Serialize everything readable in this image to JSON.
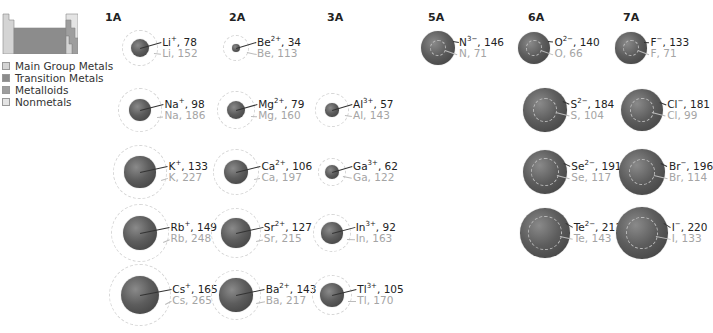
{
  "legend": {
    "items": [
      {
        "label": "Main Group Metals",
        "color": "#d4d4d4"
      },
      {
        "label": "Transition Metals",
        "color": "#8c8c8c"
      },
      {
        "label": "Metalloids",
        "color": "#9e9e9e"
      },
      {
        "label": "Nonmetals",
        "color": "#e4e4e4"
      }
    ]
  },
  "columns": [
    {
      "label": "1A",
      "x": 105
    },
    {
      "label": "2A",
      "x": 229
    },
    {
      "label": "3A",
      "x": 327
    },
    {
      "label": "5A",
      "x": 428
    },
    {
      "label": "6A",
      "x": 528
    },
    {
      "label": "7A",
      "x": 623
    }
  ],
  "ions": [
    {
      "ion": "Li",
      "charge": "+",
      "ion_radius": 78,
      "atom": "Li",
      "atom_radius": 152,
      "cx": 140,
      "cy": 48,
      "type": "cation"
    },
    {
      "ion": "Be",
      "charge": "2+",
      "ion_radius": 34,
      "atom": "Be",
      "atom_radius": 113,
      "cx": 236,
      "cy": 48,
      "type": "cation"
    },
    {
      "ion": "N",
      "charge": "3−",
      "ion_radius": 146,
      "atom": "N",
      "atom_radius": 71,
      "cx": 438,
      "cy": 48,
      "type": "anion"
    },
    {
      "ion": "O",
      "charge": "2−",
      "ion_radius": 140,
      "atom": "O",
      "atom_radius": 66,
      "cx": 534,
      "cy": 48,
      "type": "anion"
    },
    {
      "ion": "F",
      "charge": "−",
      "ion_radius": 133,
      "atom": "F",
      "atom_radius": 71,
      "cx": 631,
      "cy": 48,
      "type": "anion"
    },
    {
      "ion": "Na",
      "charge": "+",
      "ion_radius": 98,
      "atom": "Na",
      "atom_radius": 186,
      "cx": 140,
      "cy": 110,
      "type": "cation"
    },
    {
      "ion": "Mg",
      "charge": "2+",
      "ion_radius": 79,
      "atom": "Mg",
      "atom_radius": 160,
      "cx": 236,
      "cy": 110,
      "type": "cation"
    },
    {
      "ion": "Al",
      "charge": "3+",
      "ion_radius": 57,
      "atom": "Al",
      "atom_radius": 143,
      "cx": 332,
      "cy": 110,
      "type": "cation"
    },
    {
      "ion": "S",
      "charge": "2−",
      "ion_radius": 184,
      "atom": "S",
      "atom_radius": 104,
      "cx": 545,
      "cy": 110,
      "type": "anion"
    },
    {
      "ion": "Cl",
      "charge": "−",
      "ion_radius": 181,
      "atom": "Cl",
      "atom_radius": 99,
      "cx": 642,
      "cy": 110,
      "type": "anion"
    },
    {
      "ion": "K",
      "charge": "+",
      "ion_radius": 133,
      "atom": "K",
      "atom_radius": 227,
      "cx": 140,
      "cy": 172,
      "type": "cation"
    },
    {
      "ion": "Ca",
      "charge": "2+",
      "ion_radius": 106,
      "atom": "Ca",
      "atom_radius": 197,
      "cx": 236,
      "cy": 172,
      "type": "cation"
    },
    {
      "ion": "Ga",
      "charge": "3+",
      "ion_radius": 62,
      "atom": "Ga",
      "atom_radius": 122,
      "cx": 332,
      "cy": 172,
      "type": "cation"
    },
    {
      "ion": "Se",
      "charge": "2−",
      "ion_radius": 191,
      "atom": "Se",
      "atom_radius": 117,
      "cx": 545,
      "cy": 172,
      "type": "anion"
    },
    {
      "ion": "Br",
      "charge": "−",
      "ion_radius": 196,
      "atom": "Br",
      "atom_radius": 114,
      "cx": 642,
      "cy": 172,
      "type": "anion"
    },
    {
      "ion": "Rb",
      "charge": "+",
      "ion_radius": 149,
      "atom": "Rb",
      "atom_radius": 248,
      "cx": 140,
      "cy": 233,
      "type": "cation"
    },
    {
      "ion": "Sr",
      "charge": "2+",
      "ion_radius": 127,
      "atom": "Sr",
      "atom_radius": 215,
      "cx": 236,
      "cy": 233,
      "type": "cation"
    },
    {
      "ion": "In",
      "charge": "3+",
      "ion_radius": 92,
      "atom": "In",
      "atom_radius": 163,
      "cx": 332,
      "cy": 233,
      "type": "cation"
    },
    {
      "ion": "Te",
      "charge": "2−",
      "ion_radius": 211,
      "atom": "Te",
      "atom_radius": 143,
      "cx": 545,
      "cy": 233,
      "type": "anion"
    },
    {
      "ion": "I",
      "charge": "−",
      "ion_radius": 220,
      "atom": "I",
      "atom_radius": 133,
      "cx": 642,
      "cy": 233,
      "type": "anion"
    },
    {
      "ion": "Cs",
      "charge": "+",
      "ion_radius": 165,
      "atom": "Cs",
      "atom_radius": 265,
      "cx": 140,
      "cy": 295,
      "type": "cation"
    },
    {
      "ion": "Ba",
      "charge": "2+",
      "ion_radius": 143,
      "atom": "Ba",
      "atom_radius": 217,
      "cx": 236,
      "cy": 295,
      "type": "cation"
    },
    {
      "ion": "Tl",
      "charge": "3+",
      "ion_radius": 105,
      "atom": "Tl",
      "atom_radius": 170,
      "cx": 332,
      "cy": 295,
      "type": "cation"
    }
  ],
  "colors": {
    "ion_fill": "#5d5d5d",
    "ion_label": "#222222",
    "atom_label": "#a4a4a4",
    "shell_dash": "#d6d6d6"
  }
}
